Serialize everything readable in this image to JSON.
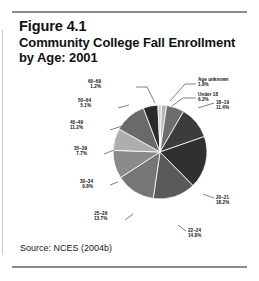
{
  "figure": {
    "title_line_1": "Figure 4.1",
    "title_line_2": "Community College Fall Enrollment",
    "title_line_3": "by Age: 2001",
    "source": "Source: NCES (2004b)"
  },
  "chart_data": {
    "type": "pie",
    "title": "Community College Fall Enrollment by Age: 2001",
    "legend_position": "callout-labels",
    "grid": false,
    "units": "percent",
    "categories": [
      "Age unknown",
      "Under 18",
      "18–19",
      "20–21",
      "22–24",
      "25–29",
      "30–34",
      "35–39",
      "40–49",
      "50–64",
      "60–69"
    ],
    "values": [
      1.8,
      6.2,
      11.4,
      18.2,
      14.8,
      13.7,
      9.8,
      7.7,
      11.2,
      5.1,
      1.2
    ],
    "labels": [
      "1.8%",
      "6.2%",
      "11.4%",
      "18.2%",
      "14.8%",
      "13.7%",
      "9.8%",
      "7.7%",
      "11.2%",
      "5.1%",
      "1.2%"
    ],
    "colors": [
      "#b4b4b4",
      "#6e6e6e",
      "#3c3c3c",
      "#303030",
      "#5a5a5a",
      "#767676",
      "#8a8a8a",
      "#aeaeae",
      "#6a6a6a",
      "#2a2a2a",
      "#cfcfcf"
    ],
    "slices": [
      {
        "name": "Age unknown",
        "value": 1.8,
        "label": "Age unknown",
        "pct": "1.8%",
        "color": "#b4b4b4"
      },
      {
        "name": "Under 18",
        "value": 6.2,
        "label": "Under 18",
        "pct": "6.2%",
        "color": "#6e6e6e"
      },
      {
        "name": "18-19",
        "value": 11.4,
        "label": "18–19",
        "pct": "11.4%",
        "color": "#3c3c3c"
      },
      {
        "name": "20-21",
        "value": 18.2,
        "label": "20–21",
        "pct": "18.2%",
        "color": "#303030"
      },
      {
        "name": "22-24",
        "value": 14.8,
        "label": "22–24",
        "pct": "14.8%",
        "color": "#5a5a5a"
      },
      {
        "name": "25-29",
        "value": 13.7,
        "label": "25–29",
        "pct": "13.7%",
        "color": "#767676"
      },
      {
        "name": "30-34",
        "value": 9.8,
        "label": "30–34",
        "pct": "9.8%",
        "color": "#8a8a8a"
      },
      {
        "name": "35-39",
        "value": 7.7,
        "label": "35–39",
        "pct": "7.7%",
        "color": "#aeaeae"
      },
      {
        "name": "40-49",
        "value": 11.2,
        "label": "40–49",
        "pct": "11.2%",
        "color": "#6a6a6a"
      },
      {
        "name": "50-64",
        "value": 5.1,
        "label": "50–64",
        "pct": "5.1%",
        "color": "#2a2a2a"
      },
      {
        "name": "60-69",
        "value": 1.2,
        "label": "60–69",
        "pct": "1.2%",
        "color": "#cfcfcf"
      }
    ]
  }
}
